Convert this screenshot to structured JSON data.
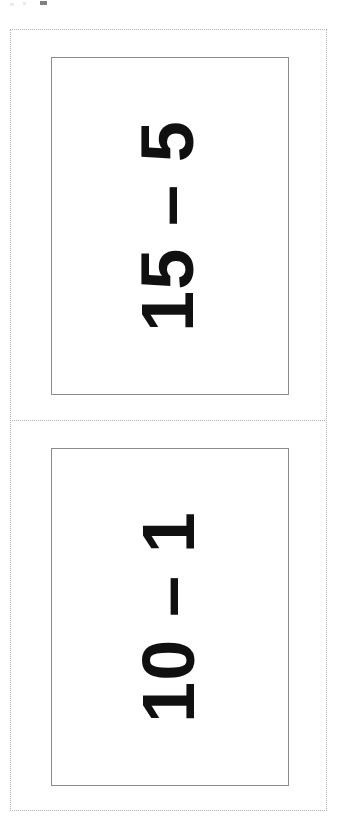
{
  "page": {
    "background_color": "#ffffff",
    "orientation": "portrait",
    "width_px": 340,
    "height_px": 827
  },
  "cut_guides": {
    "outer_frame_style": "dotted",
    "outer_frame_color": "#b2b2b2",
    "divider_style": "dotted",
    "divider_color": "#b2b2b2"
  },
  "cards": [
    {
      "id": "card-top",
      "problem_text": "15 – 5",
      "operand_left": "15",
      "operator": "–",
      "operand_right": "5",
      "answer_visible": false,
      "text_rotation_deg": -90,
      "text_color": "#101010",
      "border_color": "#8c8c8c",
      "background_color": "#ffffff"
    },
    {
      "id": "card-bottom",
      "problem_text": "10 – 1",
      "operand_left": "10",
      "operator": "–",
      "operand_right": "1",
      "answer_visible": false,
      "text_rotation_deg": -90,
      "text_color": "#101010",
      "border_color": "#8c8c8c",
      "background_color": "#ffffff"
    }
  ]
}
